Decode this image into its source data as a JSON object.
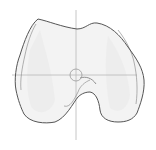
{
  "diagram": {
    "colors": {
      "background": "#ffffff",
      "outline": "#555555",
      "inner_outline": "#8a8a8a",
      "fill": "#f2f2f2",
      "shade": "#e6e6e6",
      "crosshair": "#b5b5b5"
    },
    "crosshair": {
      "center_x": 76,
      "center_y": 75,
      "vertical": {
        "x": 76,
        "y1": 10,
        "y2": 140
      },
      "horizontal": {
        "y": 75,
        "x1": 12,
        "x2": 137
      },
      "circle_radius": 6
    }
  }
}
